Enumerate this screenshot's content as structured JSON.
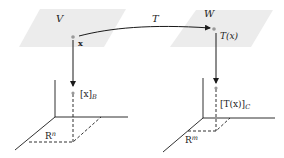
{
  "diagram": {
    "colors": {
      "plane_fill": "#ececec",
      "line": "#1a1a1a",
      "point": "#9a9a9a"
    },
    "left": {
      "space_label": "V",
      "vector_label": "x",
      "coord_label_main": "[x]",
      "coord_label_sub": "B",
      "rn_label_base": "R",
      "rn_label_sup": "n"
    },
    "right": {
      "space_label": "W",
      "vector_label": "T(x)",
      "coord_label_main": "[T(x)]",
      "coord_label_sub": "C",
      "rm_label_base": "R",
      "rm_label_sup": "m"
    },
    "map_label": "T"
  }
}
